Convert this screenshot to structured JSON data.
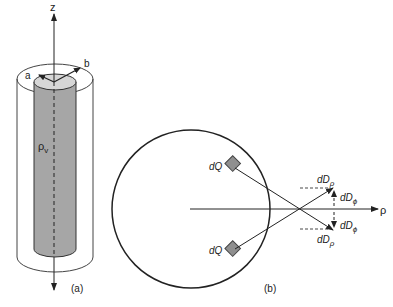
{
  "figure": {
    "panel_a": {
      "caption": "(a)",
      "axis_label": "z",
      "inner_radius_label": "a",
      "outer_radius_label": "b",
      "charge_density_label": "ρ",
      "charge_density_sub": "v",
      "colors": {
        "inner_fill": "#a6a6a6",
        "inner_top": "#d6d6d6",
        "outline": "#333333"
      }
    },
    "panel_b": {
      "caption": "(b)",
      "axis_label": "ρ",
      "charge_top_label": "dQ",
      "charge_bottom_label": "dQ",
      "dD_rho_top": {
        "main": "dD",
        "sub": "ρ"
      },
      "dD_phi_top": {
        "main": "dD",
        "sub": "ϕ"
      },
      "dD_phi_bottom": {
        "main": "dD",
        "sub": "ϕ"
      },
      "dD_rho_bottom": {
        "main": "dD",
        "sub": "ρ"
      },
      "colors": {
        "charge_fill": "#8f8f8f",
        "line": "#222222"
      }
    }
  }
}
